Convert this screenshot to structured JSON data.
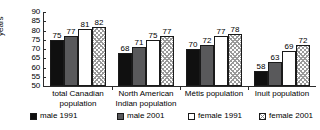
{
  "chart_data": {
    "type": "bar",
    "title": "",
    "xlabel": "",
    "ylabel": "years",
    "ylim": [
      50,
      90
    ],
    "ytick_step": 5,
    "yticks": [
      50,
      55,
      60,
      65,
      70,
      75,
      80,
      85,
      90
    ],
    "ytick_labels": [
      "50",
      "55",
      "60",
      "65",
      "70",
      "75",
      "80",
      "85",
      "90"
    ],
    "grid": false,
    "legend_position": "bottom",
    "categories": [
      "total Canadian\npopulation",
      "North American\nIndian population",
      "Métis population",
      "Inuit population"
    ],
    "series": [
      {
        "name": "male 1991",
        "values": [
          75,
          68,
          70,
          58
        ],
        "color": "#101010",
        "pattern": "solid-black"
      },
      {
        "name": "male 2001",
        "values": [
          77,
          71,
          72,
          63
        ],
        "color": "#59595b",
        "pattern": "solid-gray"
      },
      {
        "name": "female 1991",
        "values": [
          81,
          75,
          77,
          69
        ],
        "color": "#ffffff",
        "pattern": "solid-white"
      },
      {
        "name": "female 2001",
        "values": [
          82,
          77,
          78,
          72
        ],
        "color": "#ffffff",
        "pattern": "crosshatch"
      }
    ],
    "data_labels": [
      [
        "75",
        "77",
        "81",
        "82"
      ],
      [
        "68",
        "71",
        "75",
        "77"
      ],
      [
        "70",
        "72",
        "77",
        "78"
      ],
      [
        "58",
        "63",
        "69",
        "72"
      ]
    ]
  },
  "legend": {
    "items": [
      {
        "label": "male 1991"
      },
      {
        "label": "male 2001"
      },
      {
        "label": "female 1991"
      },
      {
        "label": "female 2001"
      }
    ]
  },
  "axis": {
    "y_title": "years"
  }
}
